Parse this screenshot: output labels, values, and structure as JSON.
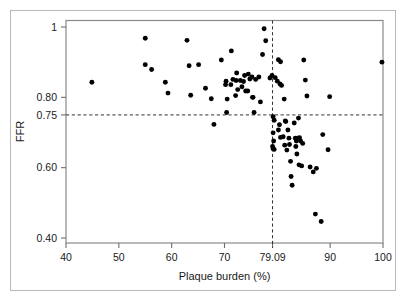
{
  "chart_data": {
    "type": "scatter",
    "title": "",
    "xlabel": "Plaque burden (%)",
    "ylabel": "FFR",
    "xlim": [
      40,
      100
    ],
    "ylim": [
      0.4,
      1.0
    ],
    "xticks": [
      40,
      50,
      60,
      70,
      79.09,
      90,
      100
    ],
    "xticklabels": [
      "40",
      "50",
      "60",
      "70",
      "79.09",
      "90",
      "100"
    ],
    "yticks": [
      0.4,
      0.6,
      0.75,
      0.8,
      1.0
    ],
    "yticklabels": [
      "0.40",
      "0.60",
      "0.75",
      "0.80",
      "1"
    ],
    "grid": false,
    "legend": null,
    "marker": "filled-circle",
    "marker_color": "#000000",
    "frame_color": "#808080",
    "reference_lines": [
      {
        "name": "ffr-cutoff",
        "orientation": "horizontal",
        "value": 0.75,
        "style": "dashed",
        "color": "#333333"
      },
      {
        "name": "plaque-burden-cutoff",
        "orientation": "vertical",
        "value": 79.09,
        "style": "dashed",
        "color": "#333333"
      }
    ],
    "points": [
      [
        44.9,
        0.843
      ],
      [
        55.0,
        0.968
      ],
      [
        55.0,
        0.893
      ],
      [
        56.2,
        0.879
      ],
      [
        58.8,
        0.843
      ],
      [
        59.3,
        0.812
      ],
      [
        62.9,
        0.962
      ],
      [
        63.3,
        0.89
      ],
      [
        63.6,
        0.806
      ],
      [
        65.1,
        0.893
      ],
      [
        66.4,
        0.826
      ],
      [
        67.5,
        0.796
      ],
      [
        68.0,
        0.723
      ],
      [
        69.4,
        0.906
      ],
      [
        70.3,
        0.846
      ],
      [
        70.2,
        0.836
      ],
      [
        70.5,
        0.795
      ],
      [
        70.4,
        0.757
      ],
      [
        71.3,
        0.932
      ],
      [
        71.6,
        0.851
      ],
      [
        71.2,
        0.836
      ],
      [
        72.3,
        0.869
      ],
      [
        72.2,
        0.848
      ],
      [
        72.5,
        0.822
      ],
      [
        72.1,
        0.805
      ],
      [
        73.0,
        0.848
      ],
      [
        73.3,
        0.83
      ],
      [
        73.8,
        0.862
      ],
      [
        73.6,
        0.845
      ],
      [
        74.0,
        0.818
      ],
      [
        74.4,
        0.818
      ],
      [
        74.5,
        0.866
      ],
      [
        74.8,
        0.852
      ],
      [
        75.2,
        0.858
      ],
      [
        75.3,
        0.8
      ],
      [
        75.4,
        0.8
      ],
      [
        75.6,
        0.757
      ],
      [
        75.9,
        0.851
      ],
      [
        76.5,
        0.858
      ],
      [
        76.8,
        0.787
      ],
      [
        77.2,
        0.922
      ],
      [
        77.5,
        0.995
      ],
      [
        77.8,
        0.961
      ],
      [
        78.6,
        0.855
      ],
      [
        79.0,
        0.862
      ],
      [
        79.2,
        0.745
      ],
      [
        79.4,
        0.735
      ],
      [
        79.2,
        0.699
      ],
      [
        79.3,
        0.676
      ],
      [
        79.1,
        0.66
      ],
      [
        79.2,
        0.654
      ],
      [
        79.4,
        0.652
      ],
      [
        79.6,
        0.856
      ],
      [
        80.0,
        0.846
      ],
      [
        80.2,
        0.907
      ],
      [
        80.6,
        0.901
      ],
      [
        80.5,
        0.838
      ],
      [
        80.8,
        0.834
      ],
      [
        80.4,
        0.722
      ],
      [
        80.2,
        0.707
      ],
      [
        80.6,
        0.686
      ],
      [
        81.1,
        0.688
      ],
      [
        81.3,
        0.795
      ],
      [
        81.5,
        0.733
      ],
      [
        81.6,
        0.731
      ],
      [
        81.4,
        0.664
      ],
      [
        81.8,
        0.65
      ],
      [
        82.0,
        0.707
      ],
      [
        82.2,
        0.684
      ],
      [
        82.3,
        0.666
      ],
      [
        82.5,
        0.618
      ],
      [
        82.6,
        0.575
      ],
      [
        82.8,
        0.55
      ],
      [
        83.2,
        0.727
      ],
      [
        83.4,
        0.684
      ],
      [
        83.6,
        0.676
      ],
      [
        83.8,
        0.684
      ],
      [
        83.5,
        0.66
      ],
      [
        83.7,
        0.639
      ],
      [
        84.0,
        0.741
      ],
      [
        84.2,
        0.685
      ],
      [
        84.4,
        0.676
      ],
      [
        84.1,
        0.608
      ],
      [
        84.6,
        0.605
      ],
      [
        84.8,
        0.669
      ],
      [
        85.0,
        0.906
      ],
      [
        85.3,
        0.849
      ],
      [
        85.6,
        0.804
      ],
      [
        86.2,
        0.602
      ],
      [
        86.8,
        0.588
      ],
      [
        87.4,
        0.598
      ],
      [
        87.2,
        0.468
      ],
      [
        88.3,
        0.447
      ],
      [
        88.6,
        0.694
      ],
      [
        89.6,
        0.651
      ],
      [
        89.9,
        0.802
      ],
      [
        99.8,
        0.9
      ]
    ],
    "n_points": 95
  },
  "axes": {
    "ylabel_text": "FFR",
    "xlabel_text": "Plaque burden (%)"
  }
}
